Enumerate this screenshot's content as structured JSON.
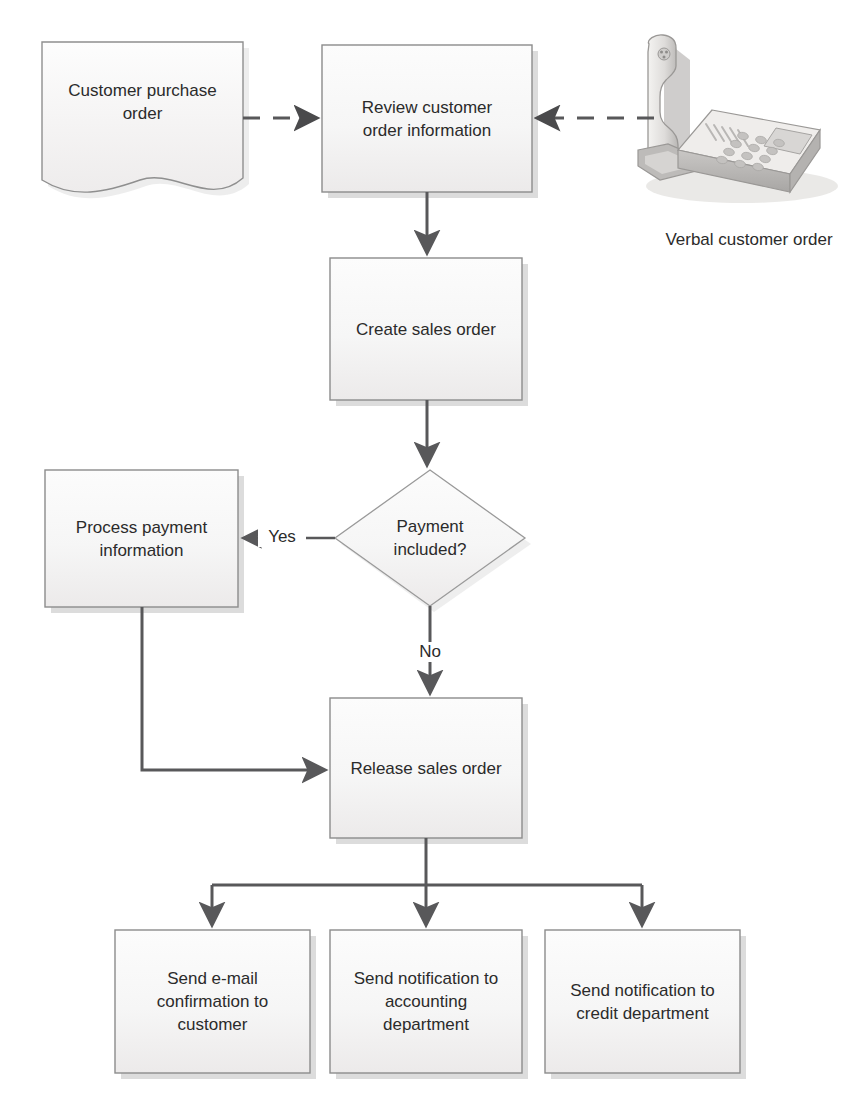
{
  "diagram": {
    "type": "flowchart",
    "palette": {
      "node_fill_top": "#fbfbfb",
      "node_fill_bottom": "#efefef",
      "node_stroke": "#8c8c8c",
      "connector": "#58585a",
      "text": "#2b2b2b",
      "shadow": "#d8d8d8",
      "background": "#ffffff"
    },
    "nodes": [
      {
        "id": "customer-purchase-order",
        "shape": "document",
        "label": "Customer purchase\norder",
        "x": 42,
        "y": 42,
        "w": 201,
        "h": 150
      },
      {
        "id": "review-customer-order-information",
        "shape": "process",
        "label": "Review customer\norder information",
        "x": 322,
        "y": 45,
        "w": 210,
        "h": 147
      },
      {
        "id": "verbal-customer-order",
        "shape": "image-telephone",
        "label": "Verbal customer order",
        "x": 630,
        "y": 28,
        "w": 210,
        "h": 180
      },
      {
        "id": "create-sales-order",
        "shape": "process",
        "label": "Create sales order",
        "x": 330,
        "y": 258,
        "w": 192,
        "h": 142
      },
      {
        "id": "payment-included",
        "shape": "decision",
        "label": "Payment\nincluded?",
        "x": 335,
        "y": 470,
        "w": 190,
        "h": 136
      },
      {
        "id": "process-payment-information",
        "shape": "process",
        "label": "Process payment\ninformation",
        "x": 45,
        "y": 470,
        "w": 193,
        "h": 137
      },
      {
        "id": "release-sales-order",
        "shape": "process",
        "label": "Release sales order",
        "x": 330,
        "y": 698,
        "w": 192,
        "h": 140
      },
      {
        "id": "send-email-confirmation-to-customer",
        "shape": "process",
        "label": "Send e-mail\nconfirmation to\ncustomer",
        "x": 115,
        "y": 930,
        "w": 195,
        "h": 143
      },
      {
        "id": "send-notification-to-accounting-department",
        "shape": "process",
        "label": "Send notification to\naccounting\ndepartment",
        "x": 330,
        "y": 930,
        "w": 192,
        "h": 143
      },
      {
        "id": "send-notification-to-credit-department",
        "shape": "process",
        "label": "Send notification to\ncredit department",
        "x": 545,
        "y": 930,
        "w": 195,
        "h": 143
      }
    ],
    "edges": [
      {
        "id": "purchase-order-to-review",
        "from": "customer-purchase-order",
        "to": "review-customer-order-information",
        "style": "dashed",
        "label": ""
      },
      {
        "id": "verbal-order-to-review",
        "from": "verbal-customer-order",
        "to": "review-customer-order-information",
        "style": "dashed",
        "label": ""
      },
      {
        "id": "review-to-create",
        "from": "review-customer-order-information",
        "to": "create-sales-order",
        "style": "solid",
        "label": ""
      },
      {
        "id": "create-to-payment-decision",
        "from": "create-sales-order",
        "to": "payment-included",
        "style": "solid",
        "label": ""
      },
      {
        "id": "payment-yes-to-process-payment",
        "from": "payment-included",
        "to": "process-payment-information",
        "style": "solid",
        "label": "Yes"
      },
      {
        "id": "payment-no-to-release",
        "from": "payment-included",
        "to": "release-sales-order",
        "style": "solid",
        "label": "No"
      },
      {
        "id": "process-payment-to-release",
        "from": "process-payment-information",
        "to": "release-sales-order",
        "style": "solid",
        "label": ""
      },
      {
        "id": "release-to-email-confirmation",
        "from": "release-sales-order",
        "to": "send-email-confirmation-to-customer",
        "style": "solid",
        "label": ""
      },
      {
        "id": "release-to-accounting-notification",
        "from": "release-sales-order",
        "to": "send-notification-to-accounting-department",
        "style": "solid",
        "label": ""
      },
      {
        "id": "release-to-credit-notification",
        "from": "release-sales-order",
        "to": "send-notification-to-credit-department",
        "style": "solid",
        "label": ""
      }
    ],
    "edge_labels": {
      "yes": "Yes",
      "no": "No"
    },
    "captions": {
      "verbal_customer_order": "Verbal customer order"
    }
  }
}
